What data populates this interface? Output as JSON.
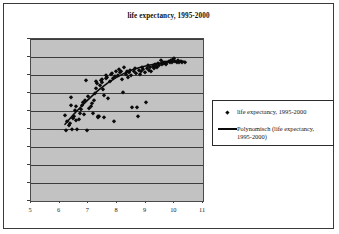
{
  "chart_data": {
    "type": "scatter",
    "title": "life expectancy, 1995-2000",
    "xlabel": "",
    "ylabel": "",
    "xlim": [
      5,
      11
    ],
    "ylim": [
      0,
      90
    ],
    "xticks": [
      "5",
      "6",
      "7",
      "8",
      "9",
      "10",
      "11"
    ],
    "yticks": [
      "0",
      "10",
      "20",
      "30",
      "40",
      "50",
      "60",
      "70",
      "80",
      "90"
    ],
    "grid": "horizontal",
    "legend_position": "right",
    "plot_background": "#c2c2c2",
    "marker_color": "#0a0a0a",
    "trendline_color": "#0a0a0a",
    "series": [
      {
        "name": "life expectancy, 1995-2000",
        "marker": "diamond",
        "points": [
          [
            6.17,
            48.0
          ],
          [
            6.21,
            39.3
          ],
          [
            6.27,
            44.5
          ],
          [
            6.32,
            42.0
          ],
          [
            6.35,
            43.6
          ],
          [
            6.38,
            53.3
          ],
          [
            6.41,
            57.8
          ],
          [
            6.44,
            40.1
          ],
          [
            6.47,
            46.2
          ],
          [
            6.5,
            47.0
          ],
          [
            6.53,
            50.6
          ],
          [
            6.56,
            52.8
          ],
          [
            6.58,
            44.8
          ],
          [
            6.62,
            40.0
          ],
          [
            6.66,
            45.5
          ],
          [
            6.7,
            49.0
          ],
          [
            6.74,
            51.0
          ],
          [
            6.78,
            53.4
          ],
          [
            6.82,
            55.0
          ],
          [
            6.86,
            48.5
          ],
          [
            6.9,
            56.3
          ],
          [
            6.93,
            67.3
          ],
          [
            6.96,
            39.5
          ],
          [
            7.0,
            58.5
          ],
          [
            7.04,
            51.5
          ],
          [
            7.08,
            53.0
          ],
          [
            7.12,
            54.5
          ],
          [
            7.16,
            49.0
          ],
          [
            7.2,
            56.0
          ],
          [
            7.24,
            60.0
          ],
          [
            7.26,
            63.0
          ],
          [
            7.28,
            66.5
          ],
          [
            7.3,
            65.5
          ],
          [
            7.32,
            46.5
          ],
          [
            7.35,
            47.0
          ],
          [
            7.38,
            47.2
          ],
          [
            7.4,
            64.5
          ],
          [
            7.43,
            67.0
          ],
          [
            7.46,
            68.0
          ],
          [
            7.48,
            66.0
          ],
          [
            7.5,
            62.0
          ],
          [
            7.53,
            59.0
          ],
          [
            7.56,
            46.8
          ],
          [
            7.6,
            68.5
          ],
          [
            7.63,
            70.0
          ],
          [
            7.66,
            69.0
          ],
          [
            7.7,
            57.5
          ],
          [
            7.74,
            66.5
          ],
          [
            7.78,
            70.5
          ],
          [
            7.82,
            71.0
          ],
          [
            7.86,
            68.5
          ],
          [
            7.9,
            44.3
          ],
          [
            7.94,
            69.5
          ],
          [
            7.98,
            72.0
          ],
          [
            8.02,
            70.0
          ],
          [
            8.06,
            73.5
          ],
          [
            8.1,
            71.5
          ],
          [
            8.14,
            72.5
          ],
          [
            8.18,
            68.0
          ],
          [
            8.22,
            60.3
          ],
          [
            8.26,
            74.5
          ],
          [
            8.3,
            70.5
          ],
          [
            8.34,
            72.0
          ],
          [
            8.38,
            69.0
          ],
          [
            8.42,
            71.5
          ],
          [
            8.46,
            73.0
          ],
          [
            8.5,
            70.0
          ],
          [
            8.54,
            52.3
          ],
          [
            8.58,
            72.5
          ],
          [
            8.62,
            74.0
          ],
          [
            8.66,
            71.0
          ],
          [
            8.7,
            52.3
          ],
          [
            8.72,
            47.3
          ],
          [
            8.76,
            73.0
          ],
          [
            8.8,
            70.5
          ],
          [
            8.84,
            72.0
          ],
          [
            8.88,
            74.5
          ],
          [
            8.92,
            73.5
          ],
          [
            8.96,
            71.5
          ],
          [
            9.0,
            55.0
          ],
          [
            9.04,
            74.0
          ],
          [
            9.08,
            75.5
          ],
          [
            9.12,
            73.0
          ],
          [
            9.16,
            74.5
          ],
          [
            9.2,
            72.5
          ],
          [
            9.24,
            75.0
          ],
          [
            9.28,
            74.0
          ],
          [
            9.32,
            76.0
          ],
          [
            9.36,
            75.0
          ],
          [
            9.4,
            74.5
          ],
          [
            9.44,
            76.5
          ],
          [
            9.48,
            75.5
          ],
          [
            9.52,
            78.3
          ],
          [
            9.56,
            76.0
          ],
          [
            9.6,
            77.0
          ],
          [
            9.64,
            76.5
          ],
          [
            9.68,
            77.5
          ],
          [
            9.72,
            76.0
          ],
          [
            9.76,
            77.0
          ],
          [
            9.8,
            78.0
          ],
          [
            9.84,
            77.5
          ],
          [
            9.88,
            78.5
          ],
          [
            9.92,
            77.0
          ],
          [
            9.96,
            78.8
          ],
          [
            10.0,
            79.5
          ],
          [
            10.04,
            78.0
          ],
          [
            10.08,
            77.5
          ],
          [
            10.12,
            78.2
          ],
          [
            10.16,
            77.0
          ],
          [
            10.22,
            77.8
          ],
          [
            10.28,
            77.2
          ],
          [
            10.36,
            77.3
          ]
        ]
      }
    ],
    "trendline": {
      "name": "Polynomisch (life expectancy, 1995-2000)",
      "type": "polynomial",
      "points": [
        [
          6.2,
          42.0
        ],
        [
          6.5,
          47.5
        ],
        [
          6.8,
          52.5
        ],
        [
          7.1,
          57.2
        ],
        [
          7.4,
          61.5
        ],
        [
          7.7,
          65.2
        ],
        [
          8.0,
          68.3
        ],
        [
          8.3,
          70.8
        ],
        [
          8.6,
          72.8
        ],
        [
          8.9,
          74.3
        ],
        [
          9.2,
          75.4
        ],
        [
          9.5,
          76.3
        ],
        [
          9.8,
          77.0
        ],
        [
          10.1,
          77.4
        ],
        [
          10.4,
          77.5
        ]
      ]
    },
    "legend": [
      {
        "label": "life expectancy, 1995-2000",
        "key": "diamond"
      },
      {
        "label": "Polynomisch (life expectancy,\n1995-2000)",
        "key": "line"
      }
    ]
  }
}
